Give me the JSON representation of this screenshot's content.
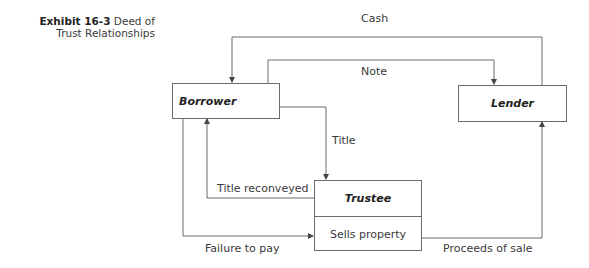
{
  "caption": {
    "exhibit": "Exhibit 16-3",
    "title_line1": "Deed of",
    "title_line2": "Trust Relationships"
  },
  "nodes": {
    "borrower": "Borrower",
    "lender": "Lender",
    "trustee": "Trustee",
    "trustee_action": "Sells property"
  },
  "edges": {
    "cash": "Cash",
    "note": "Note",
    "title": "Title",
    "title_reconveyed": "Title reconveyed",
    "failure_to_pay": "Failure to pay",
    "proceeds_of_sale": "Proceeds of sale"
  },
  "colors": {
    "line": "#6a6a6a",
    "text": "#3a3a3a"
  }
}
